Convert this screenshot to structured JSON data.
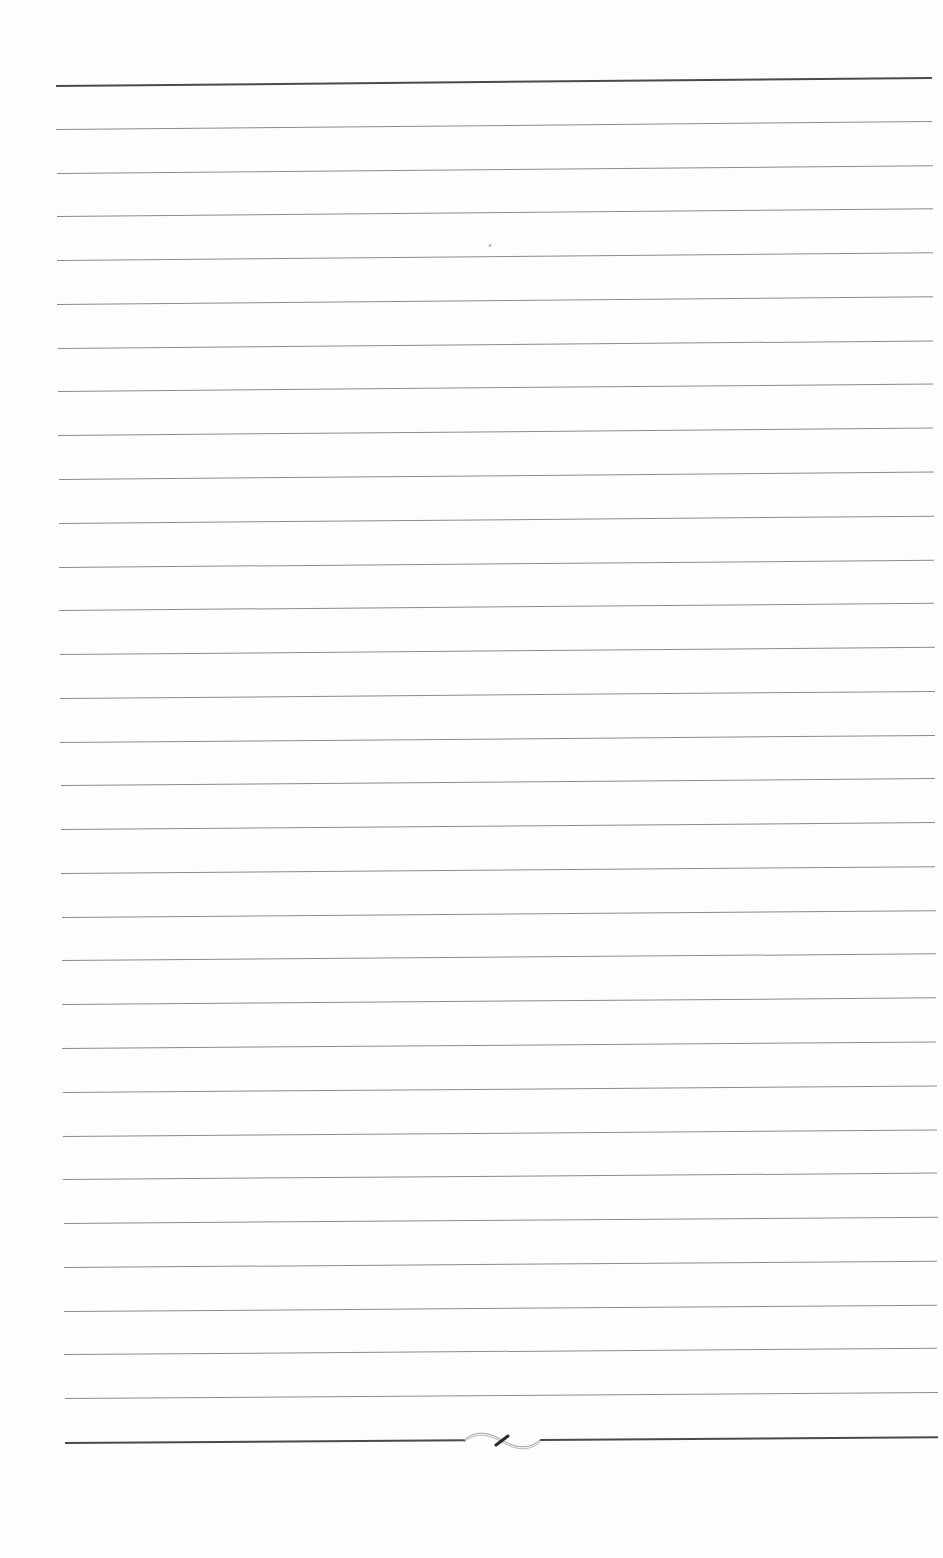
{
  "document": {
    "type": "blank ruled page",
    "text": "",
    "rule_count": 32,
    "rule_spacing_px": 43.8,
    "top_rule": {
      "style": "thick",
      "y_left": 85,
      "y_right": 77,
      "x_start": 56,
      "x_end": 932
    },
    "bottom_rule": {
      "style": "thick",
      "y_left": 1442,
      "y_right": 1436,
      "x_start": 65,
      "x_end": 938,
      "has_ornament": true
    },
    "ornament": {
      "name": "flourish-divider",
      "x_center": 500,
      "y": 1440
    },
    "colors": {
      "paper": "#fdfdfd",
      "thin_rule": "#8a8a8a",
      "thick_rule": "#4a4a4a"
    }
  }
}
